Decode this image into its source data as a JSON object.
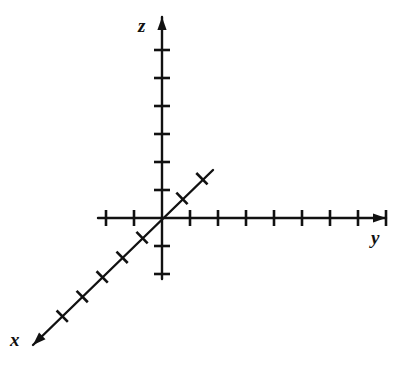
{
  "figure": {
    "kind": "3d-coordinate-axes",
    "title": "",
    "background_color": "#ffffff",
    "stroke_color": "#111111",
    "width": 409,
    "height": 367
  },
  "labels": {
    "x": "x",
    "y": "y",
    "z": "z"
  },
  "chart_data": {
    "type": "scatter",
    "title": "",
    "subtitle": "",
    "xlabel": "x",
    "ylabel": "y",
    "zlabel": "z",
    "grid": false,
    "legend": "none",
    "annotations": [],
    "origin": {
      "x": 162,
      "y": 218
    },
    "axes": [
      {
        "name": "z",
        "label": "z",
        "orientation": "vertical",
        "arrow_at": "positive-end",
        "arrow_tip": {
          "x": 162,
          "y": 17
        },
        "line_start": {
          "x": 162,
          "y": 17
        },
        "line_end": {
          "x": 162,
          "y": 279
        },
        "tick_spacing_px": 28,
        "tick_length_px": 16,
        "ticks_positive": 6,
        "ticks_negative": 2,
        "tick_values": [
          -2,
          -1,
          1,
          2,
          3,
          4,
          5,
          6
        ],
        "tick_labels_shown": false
      },
      {
        "name": "y",
        "label": "y",
        "orientation": "horizontal",
        "arrow_at": "positive-end",
        "arrow_tip": {
          "x": 386,
          "y": 218
        },
        "line_start": {
          "x": 98,
          "y": 218
        },
        "line_end": {
          "x": 386,
          "y": 218
        },
        "tick_spacing_px": 28,
        "tick_length_px": 16,
        "ticks_positive": 8,
        "ticks_negative": 2,
        "tick_values": [
          -2,
          -1,
          1,
          2,
          3,
          4,
          5,
          6,
          7,
          8
        ],
        "tick_labels_shown": false
      },
      {
        "name": "x",
        "label": "x",
        "orientation": "oblique",
        "arrow_at": "positive-end",
        "arrow_tip": {
          "x": 33,
          "y": 345
        },
        "line_start": {
          "x": 213,
          "y": 170
        },
        "line_end": {
          "x": 33,
          "y": 345
        },
        "angle_degrees": 224,
        "tick_spacing_px": 28,
        "tick_length_px": 16,
        "ticks_positive": 5,
        "ticks_negative": 2,
        "tick_values": [
          -2,
          -1,
          1,
          2,
          3,
          4,
          5
        ],
        "tick_labels_shown": false
      }
    ]
  }
}
